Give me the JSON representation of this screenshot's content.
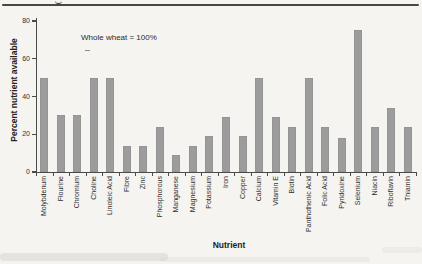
{
  "chart_data": {
    "type": "bar",
    "title": "",
    "annotation": "Whole wheat = 100%",
    "xlabel": "Nutrient",
    "ylabel": "Percent nutrient available",
    "ylim": [
      0,
      80
    ],
    "yticks": [
      0,
      20,
      40,
      60,
      80
    ],
    "grid": false,
    "legend": "none",
    "bar_color": "#9c9c9c",
    "categories": [
      "Molybdenum",
      "Flourine",
      "Chromium",
      "Choline",
      "Linoleic Acid",
      "Fibre",
      "Zinc",
      "Phosphorous",
      "Manganese",
      "Magnesium",
      "Potassium",
      "Iron",
      "Copper",
      "Calcium",
      "Vitamin E",
      "Biotin",
      "Panthothenic Acid",
      "Folic Acid",
      "Pyridoxine",
      "Selenium",
      "Niacin",
      "Riboflavin",
      "Thiamin"
    ],
    "values": [
      50,
      30,
      30,
      50,
      50,
      14,
      14,
      24,
      9,
      14,
      19,
      29,
      19,
      50,
      29,
      24,
      50,
      24,
      18,
      75,
      24,
      34,
      24
    ]
  },
  "colors": {
    "background": "#f5f4f0",
    "axis": "#4a4a4a",
    "text": "#2e2e2e",
    "top_rule": "#474747",
    "bar": "#9c9c9c"
  }
}
